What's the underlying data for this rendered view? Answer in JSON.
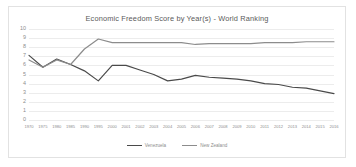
{
  "chart_data": {
    "type": "line",
    "title": "Economic Freedom Score by Year(s) - World Ranking",
    "xlabel": "",
    "ylabel": "",
    "ylim": [
      0,
      10
    ],
    "y_ticks": [
      10,
      9,
      8,
      7,
      6,
      5,
      4,
      3,
      2,
      1,
      0
    ],
    "grid": true,
    "legend_position": "bottom",
    "categories": [
      "1970",
      "1975",
      "1980",
      "1985",
      "1990",
      "1995",
      "2000",
      "2001",
      "2002",
      "2003",
      "2004",
      "2005",
      "2006",
      "2007",
      "2008",
      "2009",
      "2010",
      "2011",
      "2012",
      "2013",
      "2014",
      "2015",
      "2016"
    ],
    "series": [
      {
        "name": "Venezuela",
        "color": "#4a4a4a",
        "values": [
          7.1,
          5.8,
          6.7,
          6.1,
          5.4,
          4.3,
          6.0,
          6.0,
          5.5,
          5.0,
          4.3,
          4.5,
          4.9,
          4.7,
          4.6,
          4.5,
          4.3,
          4.0,
          3.9,
          3.6,
          3.5,
          3.2,
          2.9
        ]
      },
      {
        "name": "New Zealand",
        "color": "#8c8c8c",
        "values": [
          6.6,
          5.8,
          6.6,
          6.1,
          7.8,
          8.9,
          8.5,
          8.5,
          8.5,
          8.5,
          8.5,
          8.5,
          8.3,
          8.4,
          8.4,
          8.4,
          8.4,
          8.5,
          8.5,
          8.5,
          8.6,
          8.6,
          8.6
        ]
      }
    ]
  },
  "colors": {
    "frame_border": "#e2e2e2",
    "gridline": "#ececec",
    "axis_text": "#8d8d8d",
    "title_text": "#5a5a5a"
  }
}
